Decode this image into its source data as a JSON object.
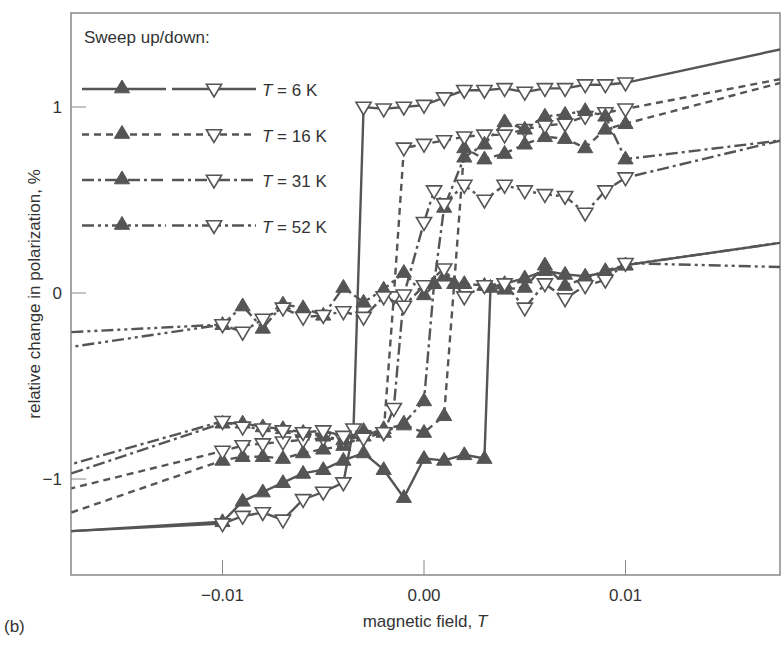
{
  "panel_label": "(b)",
  "colors": {
    "line": "#555555",
    "marker_fill": "#555555",
    "axis": "#888888",
    "text": "#333333",
    "background": "#ffffff"
  },
  "chart_data": {
    "type": "line",
    "title": "",
    "xlabel": "magnetic field, T",
    "ylabel": "relative change in polarization, %",
    "xlim": [
      -0.0175,
      0.0177
    ],
    "ylim": [
      -1.52,
      1.5
    ],
    "xticks": [
      -0.01,
      0.0,
      0.01
    ],
    "xtick_labels": [
      "−0.01",
      "0.00",
      "0.01"
    ],
    "yticks": [
      -1,
      0,
      1
    ],
    "ytick_labels": [
      "−1",
      "0",
      "1"
    ],
    "grid": false,
    "legend": {
      "title": "Sweep up/down:",
      "position": "upper left",
      "entries": [
        {
          "label": "T = 6 K",
          "temp": "6",
          "style": "solid"
        },
        {
          "label": "T = 16 K",
          "temp": "16",
          "style": "dashed"
        },
        {
          "label": "T = 31 K",
          "temp": "31",
          "style": "dashdot"
        },
        {
          "label": "T = 52 K",
          "temp": "52",
          "style": "dashdotdot"
        }
      ]
    },
    "series": [
      {
        "name": "6 K sweep up",
        "style": "solid",
        "marker": "filled-up-triangle",
        "x": [
          -0.0175,
          -0.01,
          -0.009,
          -0.008,
          -0.007,
          -0.006,
          -0.005,
          -0.004,
          -0.003,
          -0.002,
          -0.001,
          0.0,
          0.001,
          0.002,
          0.003,
          0.0033,
          0.004,
          0.005,
          0.006,
          0.007,
          0.008,
          0.009,
          0.01,
          0.0177
        ],
        "y": [
          -1.28,
          -1.23,
          -1.12,
          -1.07,
          -1.02,
          -0.97,
          -0.95,
          -0.9,
          -0.86,
          -0.95,
          -1.1,
          -0.89,
          -0.9,
          -0.87,
          -0.89,
          0.03,
          0.05,
          0.08,
          0.12,
          0.1,
          0.09,
          0.11,
          0.15,
          0.27
        ]
      },
      {
        "name": "6 K sweep down",
        "style": "solid",
        "marker": "open-down-triangle",
        "x": [
          0.0177,
          0.01,
          0.009,
          0.008,
          0.007,
          0.006,
          0.005,
          0.004,
          0.003,
          0.002,
          0.001,
          0.0,
          -0.001,
          -0.002,
          -0.003,
          -0.0035,
          -0.004,
          -0.005,
          -0.006,
          -0.007,
          -0.008,
          -0.009,
          -0.01,
          -0.0175
        ],
        "y": [
          1.31,
          1.13,
          1.12,
          1.12,
          1.1,
          1.1,
          1.08,
          1.1,
          1.09,
          1.09,
          1.05,
          1.01,
          1.0,
          0.99,
          1.0,
          -0.73,
          -1.02,
          -1.07,
          -1.11,
          -1.22,
          -1.18,
          -1.2,
          -1.24,
          -1.28
        ]
      },
      {
        "name": "16 K sweep up",
        "style": "dashed",
        "marker": "filled-up-triangle",
        "x": [
          -0.0175,
          -0.01,
          -0.009,
          -0.008,
          -0.007,
          -0.006,
          -0.005,
          -0.004,
          -0.003,
          -0.002,
          -0.001,
          0.0,
          0.001,
          0.0015,
          0.002,
          0.003,
          0.004,
          0.005,
          0.006,
          0.007,
          0.008,
          0.009,
          0.01,
          0.0177
        ],
        "y": [
          -1.18,
          -0.9,
          -0.88,
          -0.88,
          -0.89,
          -0.86,
          -0.84,
          -0.82,
          -0.77,
          -0.73,
          -0.71,
          -0.75,
          -0.66,
          0.05,
          0.78,
          0.72,
          0.75,
          0.8,
          0.84,
          0.83,
          0.78,
          0.88,
          0.91,
          1.13
        ]
      },
      {
        "name": "16 K sweep down",
        "style": "dashed",
        "marker": "open-down-triangle",
        "x": [
          0.0177,
          0.01,
          0.009,
          0.008,
          0.007,
          0.006,
          0.005,
          0.004,
          0.003,
          0.002,
          0.001,
          0.0,
          -0.001,
          -0.0015,
          -0.002,
          -0.003,
          -0.004,
          -0.005,
          -0.006,
          -0.007,
          -0.008,
          -0.009,
          -0.01,
          -0.0175
        ],
        "y": [
          1.15,
          0.99,
          0.97,
          0.95,
          0.91,
          0.9,
          0.88,
          0.85,
          0.85,
          0.84,
          0.82,
          0.8,
          0.78,
          -0.02,
          -0.75,
          -0.77,
          -0.79,
          -0.78,
          -0.79,
          -0.8,
          -0.81,
          -0.82,
          -0.85,
          -1.05
        ]
      },
      {
        "name": "31 K sweep up",
        "style": "dashdot",
        "marker": "filled-up-triangle",
        "x": [
          -0.0175,
          -0.01,
          -0.009,
          -0.008,
          -0.007,
          -0.006,
          -0.005,
          -0.004,
          -0.003,
          -0.002,
          -0.001,
          0.0,
          0.0005,
          0.001,
          0.002,
          0.003,
          0.004,
          0.005,
          0.006,
          0.007,
          0.008,
          0.009,
          0.01,
          0.0177
        ],
        "y": [
          -0.97,
          -0.7,
          -0.7,
          -0.72,
          -0.73,
          -0.75,
          -0.77,
          -0.79,
          -0.74,
          -0.75,
          -0.7,
          -0.58,
          0.05,
          0.46,
          0.73,
          0.8,
          0.92,
          0.88,
          0.95,
          0.96,
          0.98,
          0.95,
          0.72,
          0.82
        ]
      },
      {
        "name": "31 K sweep down",
        "style": "dashdot",
        "marker": "open-down-triangle",
        "x": [
          0.0177,
          0.01,
          0.009,
          0.008,
          0.007,
          0.006,
          0.005,
          0.004,
          0.003,
          0.002,
          0.001,
          0.0005,
          0.0,
          -0.001,
          -0.0015,
          -0.002,
          -0.003,
          -0.004,
          -0.005,
          -0.006,
          -0.007,
          -0.008,
          -0.009,
          -0.01,
          -0.0175
        ],
        "y": [
          0.82,
          0.62,
          0.55,
          0.43,
          0.52,
          0.53,
          0.55,
          0.58,
          0.5,
          0.58,
          0.48,
          0.55,
          0.38,
          -0.01,
          -0.62,
          -0.75,
          -0.78,
          -0.77,
          -0.74,
          -0.75,
          -0.74,
          -0.73,
          -0.72,
          -0.69,
          -0.92
        ]
      },
      {
        "name": "52 K sweep up",
        "style": "dashdotdot",
        "marker": "filled-up-triangle",
        "x": [
          -0.0175,
          -0.01,
          -0.009,
          -0.008,
          -0.007,
          -0.006,
          -0.005,
          -0.004,
          -0.003,
          -0.002,
          -0.001,
          0.0,
          0.001,
          0.002,
          0.003,
          0.004,
          0.005,
          0.006,
          0.007,
          0.008,
          0.009,
          0.01,
          0.0177
        ],
        "y": [
          -0.21,
          -0.17,
          -0.07,
          -0.19,
          -0.06,
          -0.08,
          -0.12,
          0.03,
          -0.05,
          0.02,
          0.11,
          -0.01,
          0.09,
          0.05,
          0.04,
          0.02,
          0.03,
          0.15,
          0.04,
          0.08,
          0.12,
          0.15,
          0.27
        ]
      },
      {
        "name": "52 K sweep down",
        "style": "dashdotdot",
        "marker": "open-down-triangle",
        "x": [
          0.0177,
          0.01,
          0.009,
          0.008,
          0.007,
          0.006,
          0.005,
          0.004,
          0.003,
          0.002,
          0.001,
          0.0,
          -0.001,
          -0.002,
          -0.003,
          -0.004,
          -0.005,
          -0.006,
          -0.007,
          -0.008,
          -0.009,
          -0.01,
          -0.0175
        ],
        "y": [
          0.14,
          0.16,
          0.07,
          0.04,
          -0.03,
          0.05,
          -0.08,
          0.05,
          0.04,
          -0.02,
          0.13,
          0.04,
          -0.07,
          -0.02,
          -0.13,
          -0.1,
          -0.12,
          -0.13,
          -0.08,
          -0.14,
          -0.21,
          -0.17,
          -0.29
        ]
      }
    ]
  }
}
